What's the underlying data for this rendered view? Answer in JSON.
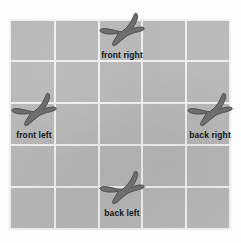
{
  "scene": {
    "title": "Dinosaur footprint grid",
    "board": {
      "background_color": "#b6b6b6",
      "gridline_color": "#eef0ef",
      "columns": 5,
      "rows": 5,
      "outer_margin_color": "#fdfdfd"
    },
    "footprint": {
      "color": "#6e6e6e",
      "outline_color": "#4e4e4e",
      "shape": "tridactyl-dinosaur-track",
      "toes": 3
    }
  },
  "footprints": [
    {
      "id": "front-right",
      "label": "front right",
      "icon": "dinosaur-footprint-icon",
      "position": "top-center",
      "grid_cell": {
        "col": 3,
        "row": 1
      }
    },
    {
      "id": "front-left",
      "label": "front left",
      "icon": "dinosaur-footprint-icon",
      "position": "middle-left",
      "grid_cell": {
        "col": 1,
        "row": 3
      }
    },
    {
      "id": "back-right",
      "label": "back right",
      "icon": "dinosaur-footprint-icon",
      "position": "middle-right",
      "grid_cell": {
        "col": 5,
        "row": 3
      }
    },
    {
      "id": "back-left",
      "label": "back left",
      "icon": "dinosaur-footprint-icon",
      "position": "bottom-center",
      "grid_cell": {
        "col": 3,
        "row": 5
      }
    }
  ]
}
